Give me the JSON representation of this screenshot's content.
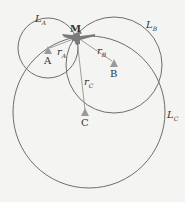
{
  "diagram": {
    "title": "",
    "points": {
      "M": {
        "label": "M",
        "x": 76,
        "y": 36
      },
      "A": {
        "label": "A",
        "x": 48,
        "y": 49
      },
      "B": {
        "label": "B",
        "x": 114,
        "y": 63
      },
      "C": {
        "label": "C",
        "x": 85,
        "y": 113
      }
    },
    "circles": [
      {
        "name": "L",
        "sub": "A",
        "cx": 48,
        "cy": 48,
        "r": 30
      },
      {
        "name": "L",
        "sub": "B",
        "cx": 114,
        "cy": 65,
        "r": 48
      },
      {
        "name": "L",
        "sub": "C",
        "cx": 89,
        "cy": 112,
        "r": 76
      }
    ],
    "radii": [
      {
        "name": "r",
        "sub": "A"
      },
      {
        "name": "r",
        "sub": "B"
      },
      {
        "name": "r",
        "sub": "C"
      }
    ],
    "colors": {
      "line": "#6e6e6e",
      "marker": "#9a9a9a",
      "aircraft": "#7a7a7a",
      "text": "#333333",
      "background": "#f4f4f2"
    }
  }
}
